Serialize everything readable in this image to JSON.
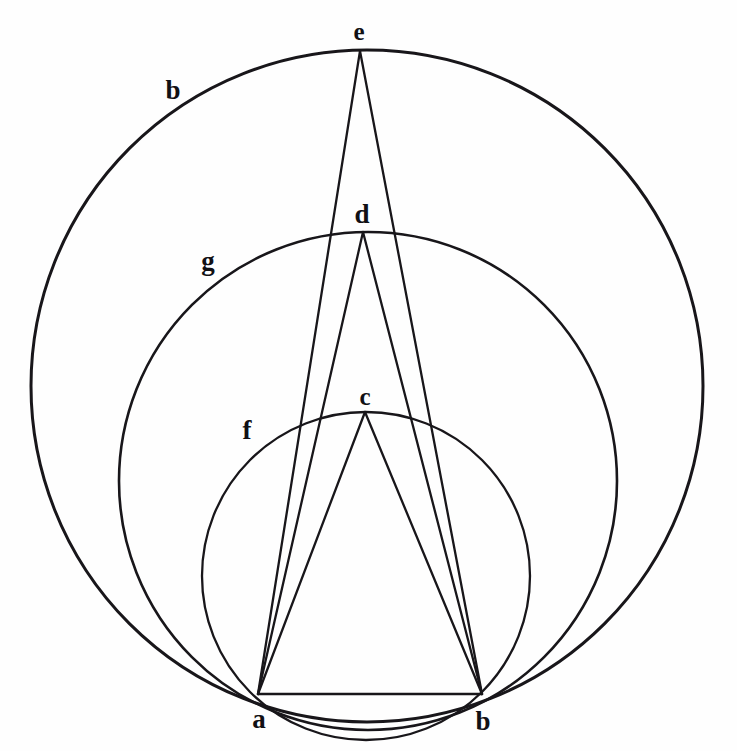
{
  "figure": {
    "background_color": "#fefefe",
    "ink_color": "#18161a",
    "canvas": {
      "width": 737,
      "height": 751
    }
  },
  "points": [
    {
      "id": "a",
      "label": "a",
      "x": 258,
      "y": 694,
      "label_x": 259,
      "label_y": 719,
      "role": "chord-endpoint-left"
    },
    {
      "id": "b",
      "label": "b",
      "x": 482,
      "y": 694,
      "label_x": 483,
      "label_y": 721,
      "role": "chord-endpoint-right"
    },
    {
      "id": "c",
      "label": "c",
      "x": 365,
      "y": 412,
      "label_x": 365,
      "label_y": 396,
      "role": "apex-small-arc"
    },
    {
      "id": "d",
      "label": "d",
      "x": 363,
      "y": 232,
      "label_x": 362,
      "label_y": 214,
      "role": "apex-middle-arc"
    },
    {
      "id": "e",
      "label": "e",
      "x": 360,
      "y": 51,
      "label_x": 359,
      "label_y": 31,
      "role": "apex-large-arc"
    }
  ],
  "arc_labels": [
    {
      "id": "b-arc",
      "label": "b",
      "label_x": 173,
      "label_y": 90,
      "describes": "outer-large-circle"
    },
    {
      "id": "g-arc",
      "label": "g",
      "label_x": 208,
      "label_y": 261,
      "describes": "middle-circle"
    },
    {
      "id": "f-arc",
      "label": "f",
      "label_x": 247,
      "label_y": 430,
      "describes": "inner-small-circle"
    }
  ],
  "circles": [
    {
      "id": "outer-large-circle",
      "arc_label": "b",
      "center_x": 367,
      "center_y": 386,
      "radius": 336,
      "apex_point": "e",
      "stroke_width": 3.0
    },
    {
      "id": "middle-circle",
      "arc_label": "g",
      "center_x": 368,
      "center_y": 481,
      "radius": 249,
      "apex_point": "d",
      "stroke_width": 2.6
    },
    {
      "id": "inner-small-circle",
      "arc_label": "f",
      "center_x": 366,
      "center_y": 576,
      "radius": 164,
      "apex_point": "c",
      "stroke_width": 2.3
    }
  ],
  "segments": [
    {
      "id": "chord-ab",
      "from": "a",
      "to": "b",
      "stroke_width": 2.4
    },
    {
      "id": "ray-a-c",
      "from": "a",
      "to": "c",
      "stroke_width": 2.3
    },
    {
      "id": "ray-a-d",
      "from": "a",
      "to": "d",
      "stroke_width": 2.3
    },
    {
      "id": "ray-a-e",
      "from": "a",
      "to": "e",
      "stroke_width": 2.3
    },
    {
      "id": "ray-b-c",
      "from": "b",
      "to": "c",
      "stroke_width": 2.3
    },
    {
      "id": "ray-b-d",
      "from": "b",
      "to": "d",
      "stroke_width": 2.3
    },
    {
      "id": "ray-b-e",
      "from": "b",
      "to": "e",
      "stroke_width": 2.3
    }
  ],
  "chart_data": {
    "type": "diagram",
    "elements": {
      "chord_endpoints": [
        "a",
        "b"
      ],
      "apex_points": [
        "c",
        "d",
        "e"
      ],
      "arc_names": [
        "f",
        "g",
        "b"
      ],
      "arc_to_apex": {
        "f": "c",
        "g": "d",
        "b": "e"
      }
    }
  }
}
